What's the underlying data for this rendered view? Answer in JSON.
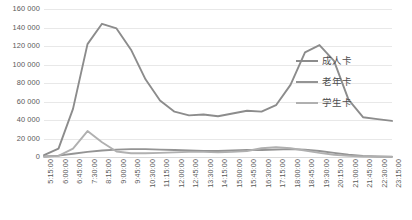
{
  "chart_data": {
    "type": "line",
    "title": "",
    "subtitle": "",
    "xlabel": "",
    "ylabel": "",
    "ylim": [
      0,
      160000
    ],
    "ytick_step": 20000,
    "ytick_labels": [
      "0",
      "20 000",
      "40 000",
      "60 000",
      "80 000",
      "100 000",
      "120 000",
      "140 000",
      "160 000"
    ],
    "ytick_values": [
      0,
      20000,
      40000,
      60000,
      80000,
      100000,
      120000,
      140000,
      160000
    ],
    "grid": "horizontal",
    "legend_position": "right",
    "categories": [
      "5:15:00",
      "6:00:00",
      "6:45:00",
      "7:30:00",
      "8:15:00",
      "9:00:00",
      "9:45:00",
      "10:30:00",
      "11:15:00",
      "12:00:00",
      "12:45:00",
      "13:30:00",
      "14:15:00",
      "15:00:00",
      "15:45:00",
      "16:30:00",
      "17:15:00",
      "18:00:00",
      "18:45:00",
      "19:30:00",
      "20:15:00",
      "21:00:00",
      "21:45:00",
      "22:30:00",
      "23:15:00"
    ],
    "series": [
      {
        "name": "成人卡",
        "color": "#8c8c8c",
        "values": [
          2000,
          9000,
          52000,
          122000,
          144000,
          139000,
          116000,
          84000,
          61000,
          49000,
          45000,
          46000,
          44000,
          47000,
          50000,
          49000,
          56000,
          78000,
          113000,
          121000,
          104000,
          62000,
          43000,
          41000,
          39000
        ]
      },
      {
        "name": "老年卡",
        "color": "#949494",
        "values": [
          500,
          1500,
          3500,
          5500,
          7000,
          8000,
          8500,
          8500,
          8000,
          7500,
          7000,
          6500,
          6500,
          7000,
          7500,
          7500,
          8000,
          8500,
          8000,
          6500,
          4500,
          2500,
          1200,
          600,
          300
        ]
      },
      {
        "name": "学生卡",
        "color": "#b0b0b0",
        "values": [
          300,
          1200,
          9000,
          28000,
          16000,
          6000,
          4000,
          4000,
          4500,
          5000,
          5500,
          5500,
          5000,
          5500,
          6500,
          9500,
          10500,
          9500,
          7000,
          4500,
          2500,
          1200,
          600,
          300,
          150
        ]
      }
    ]
  },
  "legend": {
    "items": [
      {
        "label": "成人卡",
        "color": "#8c8c8c"
      },
      {
        "label": "老年卡",
        "color": "#949494"
      },
      {
        "label": "学生卡",
        "color": "#b0b0b0"
      }
    ]
  }
}
